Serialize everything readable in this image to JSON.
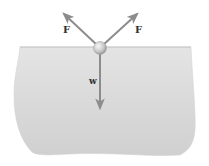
{
  "diagram": {
    "type": "free-body diagram",
    "labels": {
      "force_left": "F",
      "force_right": "F",
      "weight": "w"
    },
    "colors": {
      "liquid_fill_top": "#e2e2e2",
      "liquid_fill_bottom": "#d2d2d2",
      "arrow": "#8c8c8c",
      "ball_highlight": "#f4f4f4",
      "ball_shadow": "#9a9a9a",
      "label": "#2e2e2e"
    }
  }
}
